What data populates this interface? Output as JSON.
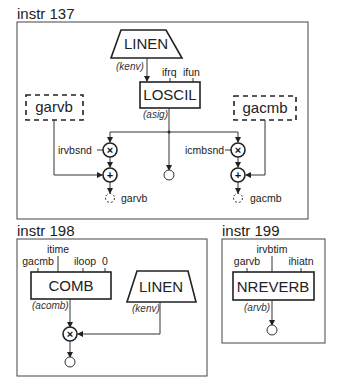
{
  "instruments": [
    {
      "title": "instr 137",
      "linen": {
        "label": "LINEN",
        "output": "(kenv)"
      },
      "loscil": {
        "label": "LOSCIL",
        "inputs": [
          "ifrq",
          "ifun"
        ],
        "output": "(asig)"
      },
      "globals": [
        {
          "label": "garvb",
          "send": "irvbsnd",
          "output": "garvb"
        },
        {
          "label": "gacmb",
          "send": "icmbsnd",
          "output": "gacmb"
        }
      ],
      "operators": {
        "multiply": "×",
        "add": "+"
      }
    },
    {
      "title": "instr 198",
      "comb": {
        "label": "COMB",
        "inputs": [
          "gacmb",
          "itime",
          "iloop",
          "0"
        ],
        "output": "(acomb)"
      },
      "linen": {
        "label": "LINEN",
        "output": "(kenv)"
      },
      "operators": {
        "multiply": "×"
      }
    },
    {
      "title": "instr 199",
      "nreverb": {
        "label": "NREVERB",
        "inputs": [
          "garvb",
          "irvbtim",
          "ihiatn"
        ],
        "output": "(arvb)"
      }
    }
  ]
}
